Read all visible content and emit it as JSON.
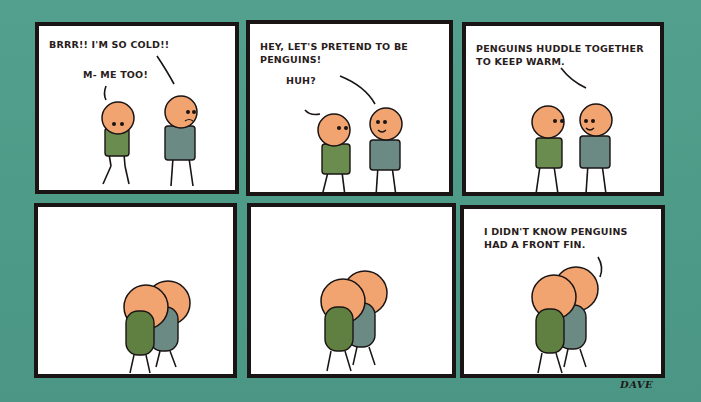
{
  "comic": {
    "background_color": "#4d9a89",
    "skin_color": "#f1a470",
    "shirt_green": "#5c7d3e",
    "shirt_gray": "#5d7d73",
    "panels": [
      {
        "id": 1,
        "lines": [
          "BRRR!! I'M SO COLD!!",
          "M- ME TOO!"
        ]
      },
      {
        "id": 2,
        "lines": [
          "HEY, LET'S PRETEND TO BE\nPENGUINS!",
          "HUH?"
        ]
      },
      {
        "id": 3,
        "lines": [
          "PENGUINS HUDDLE TOGETHER\nTO KEEP WARM."
        ]
      },
      {
        "id": 4,
        "lines": []
      },
      {
        "id": 5,
        "lines": []
      },
      {
        "id": 6,
        "lines": [
          "I DIDN'T KNOW PENGUINS\nHAD A FRONT FIN."
        ]
      }
    ],
    "signature": "DAVE"
  }
}
